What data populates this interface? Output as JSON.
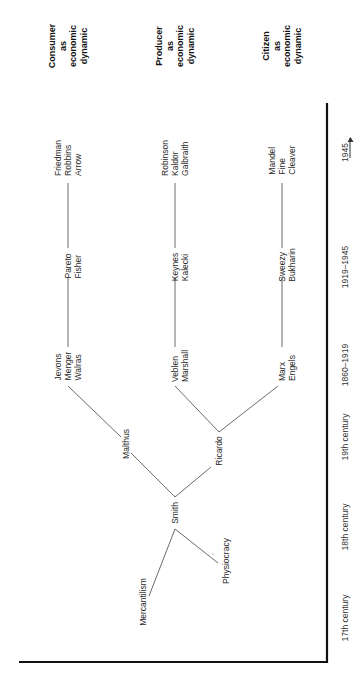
{
  "headers": {
    "consumer": [
      "Consumer",
      "as",
      "economic",
      "dynamic"
    ],
    "producer": [
      "Producer",
      "as",
      "economic",
      "dynamic"
    ],
    "citizen": [
      "Citizen",
      "as",
      "economic",
      "dynamic"
    ]
  },
  "nodes": {
    "consumer_1945": [
      "Friedman",
      "Robbins",
      "Arrow"
    ],
    "producer_1945": [
      "Robinson",
      "Kaldor",
      "Galbraith"
    ],
    "citizen_1945": [
      "Mandel",
      "Fine",
      "Cleaver"
    ],
    "consumer_1919": [
      "Pareto",
      "Fisher"
    ],
    "producer_1919": [
      "Keynes",
      "Kalecki"
    ],
    "citizen_1919": [
      "Sweezy",
      "Bukharin"
    ],
    "consumer_1860": [
      "Jevons",
      "Menger",
      "Walras"
    ],
    "producer_1860": [
      "Veblen",
      "Marshall"
    ],
    "citizen_1860": [
      "Marx",
      "Engels"
    ],
    "malthus": "Malthus",
    "ricardo": "Ricardo",
    "smith": "Smith",
    "mercantilism": "Mercantilism",
    "physiocracy": "Physiocracy"
  },
  "periods": [
    "1945",
    "1919–1945",
    "1860–1919",
    "19th century",
    "18th century",
    "17th century"
  ],
  "colors": {
    "line": "#333333",
    "axis": "#111111",
    "background": "#ffffff"
  }
}
